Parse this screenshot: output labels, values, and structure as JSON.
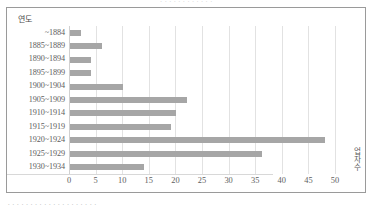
{
  "page": {
    "top_clipped_text": "∙ ∙ ∙ ∙ ∙ ∙ ∙ ∙ ∙ ∙ ∙ ∙",
    "bottom_clipped_text": "∙ ∙ ∙ ∙ ∙ ∙ ∙ ∙ ∙ ∙ ∙ ∙ ∙ ∙ ∙ ∙ ∙ ∙ ∙ ∙"
  },
  "chart_data": {
    "type": "bar",
    "orientation": "horizontal",
    "title": "",
    "xlabel": "업자수",
    "ylabel": "연도",
    "categories": [
      "~1884",
      "1885~1889",
      "1890~1894",
      "1895~1899",
      "1900~1904",
      "1905~1909",
      "1910~1914",
      "1915~1919",
      "1920~1924",
      "1925~1929",
      "1930~1934"
    ],
    "values": [
      2,
      6,
      4,
      4,
      10,
      22,
      20,
      19,
      48,
      36,
      14
    ],
    "xticks": [
      0,
      5,
      10,
      15,
      20,
      25,
      30,
      35,
      40,
      45,
      50
    ],
    "xlim": [
      0,
      50
    ],
    "grid": true,
    "legend": false,
    "bar_color": "#a6a6a6",
    "gridline_color": "#e2e2e2",
    "axis_text_color": "#5e5e5e"
  },
  "axis_title_vertical_chars": [
    "업",
    "자",
    "수"
  ]
}
